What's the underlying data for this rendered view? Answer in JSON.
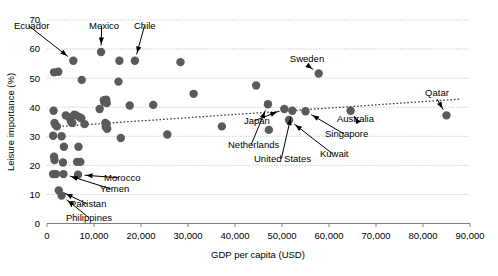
{
  "chart_data": {
    "type": "scatter",
    "title": "",
    "xlabel": "GDP per capita (USD)",
    "ylabel": "Leisure importance (%)",
    "xlim": [
      0,
      90000
    ],
    "ylim": [
      0,
      70
    ],
    "xticks": [
      0,
      10000,
      20000,
      30000,
      40000,
      50000,
      60000,
      70000,
      80000,
      90000
    ],
    "xticklabels": [
      "0",
      "10,000",
      "20,000",
      "30,000",
      "40,000",
      "50,000",
      "60,000",
      "70,000",
      "80,000",
      "90,000"
    ],
    "yticks": [
      0,
      10,
      20,
      30,
      40,
      50,
      60,
      70
    ],
    "yticklabels": [
      "0",
      "10",
      "20",
      "30",
      "40",
      "50",
      "60",
      "70"
    ],
    "grid": "horizontal-dotted",
    "legend": "none",
    "marker_color": "#5a5a5a",
    "marker_size": 4.2,
    "points": [
      {
        "x": 5600,
        "y": 56.0
      },
      {
        "x": 11500,
        "y": 59.0
      },
      {
        "x": 15400,
        "y": 56.0
      },
      {
        "x": 18700,
        "y": 56.0
      },
      {
        "x": 28400,
        "y": 55.5
      },
      {
        "x": 1500,
        "y": 52.0
      },
      {
        "x": 2400,
        "y": 52.2
      },
      {
        "x": 7400,
        "y": 49.4
      },
      {
        "x": 15200,
        "y": 48.8
      },
      {
        "x": 31200,
        "y": 44.6
      },
      {
        "x": 44500,
        "y": 47.5
      },
      {
        "x": 12200,
        "y": 41.8
      },
      {
        "x": 12700,
        "y": 41.4
      },
      {
        "x": 12100,
        "y": 42.4
      },
      {
        "x": 12600,
        "y": 42.6
      },
      {
        "x": 17600,
        "y": 40.6
      },
      {
        "x": 22600,
        "y": 40.8
      },
      {
        "x": 11200,
        "y": 39.4
      },
      {
        "x": 1400,
        "y": 38.8
      },
      {
        "x": 4000,
        "y": 37.2
      },
      {
        "x": 4600,
        "y": 36.6
      },
      {
        "x": 5800,
        "y": 37.4
      },
      {
        "x": 6200,
        "y": 37.2
      },
      {
        "x": 6900,
        "y": 36.6
      },
      {
        "x": 7300,
        "y": 36.2
      },
      {
        "x": 5100,
        "y": 35.0
      },
      {
        "x": 5400,
        "y": 34.6
      },
      {
        "x": 8000,
        "y": 34.2
      },
      {
        "x": 1600,
        "y": 34.6
      },
      {
        "x": 2100,
        "y": 33.4
      },
      {
        "x": 12400,
        "y": 34.6
      },
      {
        "x": 12700,
        "y": 34.2
      },
      {
        "x": 12500,
        "y": 33.2
      },
      {
        "x": 12800,
        "y": 32.6
      },
      {
        "x": 37200,
        "y": 33.4
      },
      {
        "x": 1300,
        "y": 30.2
      },
      {
        "x": 3100,
        "y": 30.0
      },
      {
        "x": 15700,
        "y": 29.4
      },
      {
        "x": 25600,
        "y": 30.6
      },
      {
        "x": 3600,
        "y": 26.4
      },
      {
        "x": 6700,
        "y": 26.4
      },
      {
        "x": 1500,
        "y": 23.0
      },
      {
        "x": 1600,
        "y": 21.8
      },
      {
        "x": 3400,
        "y": 21.0
      },
      {
        "x": 6400,
        "y": 21.2
      },
      {
        "x": 7100,
        "y": 21.2
      },
      {
        "x": 1300,
        "y": 17.0
      },
      {
        "x": 1900,
        "y": 17.0
      },
      {
        "x": 3500,
        "y": 17.0
      },
      {
        "x": 6600,
        "y": 16.8
      },
      {
        "x": 2500,
        "y": 11.4
      },
      {
        "x": 3100,
        "y": 9.6
      },
      {
        "x": 47000,
        "y": 41.0
      },
      {
        "x": 50500,
        "y": 39.4
      },
      {
        "x": 52200,
        "y": 38.8
      },
      {
        "x": 55000,
        "y": 38.6
      },
      {
        "x": 51500,
        "y": 35.6
      },
      {
        "x": 47200,
        "y": 32.2
      },
      {
        "x": 57800,
        "y": 51.6
      },
      {
        "x": 64600,
        "y": 38.8
      },
      {
        "x": 85000,
        "y": 37.2
      }
    ],
    "trend_line": {
      "label": "linear trend",
      "style": "dotted",
      "x_start": 1000,
      "y_start": 33.2,
      "x_end": 88000,
      "y_end": 42.8
    },
    "annotations": [
      {
        "label": "Ecuador",
        "text_x": 14,
        "text_y": 29,
        "anchor": "start",
        "point_x": 5600,
        "point_y": 56.0
      },
      {
        "label": "Mexico",
        "text_x": 89,
        "text_y": 29,
        "anchor": "start",
        "point_x": 11500,
        "point_y": 59.0
      },
      {
        "label": "Chile",
        "text_x": 134,
        "text_y": 29,
        "anchor": "start",
        "point_x": 18700,
        "point_y": 56.0
      },
      {
        "label": "Sweden",
        "text_x": 307,
        "text_y": 62,
        "anchor": "middle",
        "point_x": 57800,
        "point_y": 51.6
      },
      {
        "label": "Qatar",
        "text_x": 437,
        "text_y": 96,
        "anchor": "middle",
        "point_x": 85000,
        "point_y": 37.2
      },
      {
        "label": "Australia",
        "text_x": 337,
        "text_y": 122,
        "anchor": "start",
        "point_x": 64600,
        "point_y": 38.8
      },
      {
        "label": "Japan",
        "text_x": 244,
        "text_y": 124,
        "anchor": "start",
        "point_x": 50500,
        "point_y": 39.4
      },
      {
        "label": "Singapore",
        "text_x": 325,
        "text_y": 137,
        "anchor": "start",
        "point_x": 55000,
        "point_y": 38.6
      },
      {
        "label": "Netherlands",
        "text_x": 228,
        "text_y": 148,
        "anchor": "start",
        "point_x": 47000,
        "point_y": 41.0
      },
      {
        "label": "United States",
        "text_x": 254,
        "text_y": 162,
        "anchor": "start",
        "point_x": 52200,
        "point_y": 38.8
      },
      {
        "label": "Kuwait",
        "text_x": 320,
        "text_y": 157,
        "anchor": "start",
        "point_x": 51500,
        "point_y": 35.6
      },
      {
        "label": "Morocco",
        "text_x": 104,
        "text_y": 181,
        "anchor": "start",
        "point_x": 6600,
        "point_y": 16.8
      },
      {
        "label": "Yemen",
        "text_x": 100,
        "text_y": 192,
        "anchor": "start",
        "point_x": 3500,
        "point_y": 17.0
      },
      {
        "label": "Pakistan",
        "text_x": 70,
        "text_y": 207,
        "anchor": "start",
        "point_x": 2500,
        "point_y": 11.4
      },
      {
        "label": "Philippines",
        "text_x": 66,
        "text_y": 221,
        "anchor": "start",
        "point_x": 3100,
        "point_y": 9.6
      }
    ]
  }
}
